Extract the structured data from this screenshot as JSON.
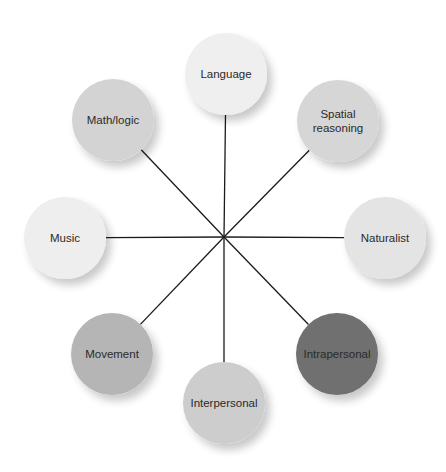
{
  "diagram": {
    "type": "radial-spoke",
    "center": {
      "x": 224,
      "y": 237
    },
    "line_color": "#1a1a1a",
    "nodes": [
      {
        "id": "language",
        "label": [
          "Language"
        ],
        "cx": 226,
        "cy": 74,
        "r": 41,
        "fill": "#efefef"
      },
      {
        "id": "spatial-reasoning",
        "label": [
          "Spatial",
          "reasoning"
        ],
        "cx": 338,
        "cy": 121,
        "r": 41,
        "fill": "#d6d6d6"
      },
      {
        "id": "naturalist",
        "label": [
          "Naturalist"
        ],
        "cx": 385,
        "cy": 238,
        "r": 41,
        "fill": "#e4e4e4"
      },
      {
        "id": "intrapersonal",
        "label": [
          "Intrapersonal"
        ],
        "cx": 337,
        "cy": 354,
        "r": 41,
        "fill": "#6f6f6f"
      },
      {
        "id": "interpersonal",
        "label": [
          "Interpersonal"
        ],
        "cx": 224,
        "cy": 403,
        "r": 41,
        "fill": "#cdcdcd"
      },
      {
        "id": "movement",
        "label": [
          "Movement"
        ],
        "cx": 112,
        "cy": 354,
        "r": 41,
        "fill": "#b5b5b5"
      },
      {
        "id": "music",
        "label": [
          "Music"
        ],
        "cx": 65,
        "cy": 238,
        "r": 41,
        "fill": "#eeeeee"
      },
      {
        "id": "math-logic",
        "label": [
          "Math/logic"
        ],
        "cx": 113,
        "cy": 120,
        "r": 41,
        "fill": "#d3d3d3"
      }
    ]
  }
}
